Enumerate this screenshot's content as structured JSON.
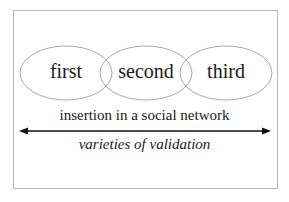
{
  "diagram": {
    "ellipses": [
      {
        "label": "first"
      },
      {
        "label": "second"
      },
      {
        "label": "third"
      }
    ],
    "axis_label_top": "insertion in a social network",
    "axis_label_bottom": "varieties of validation",
    "colors": {
      "ellipse_stroke": "#a8a8a8",
      "frame_stroke": "#b8b8b8",
      "arrow": "#111111",
      "text": "#1a1a1a"
    }
  }
}
